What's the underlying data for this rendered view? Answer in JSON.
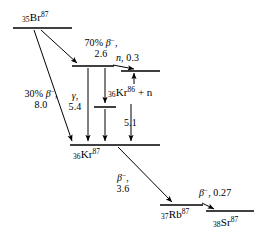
{
  "diagram": {
    "type": "nuclear-decay-level-scheme",
    "stroke_color": "#000000",
    "background_color": "#ffffff",
    "levels": [
      {
        "id": "br87",
        "nuclide_label": "Br",
        "z": "35",
        "a": "87"
      },
      {
        "id": "kr87-excited",
        "nuclide_label": "",
        "z": "",
        "a": ""
      },
      {
        "id": "kr86-plus-n",
        "nuclide_label": "Kr",
        "z": "36",
        "a": "86",
        "suffix": " + n"
      },
      {
        "id": "kr87-ground",
        "nuclide_label": "Kr",
        "z": "36",
        "a": "87"
      },
      {
        "id": "rb87",
        "nuclide_label": "Rb",
        "z": "37",
        "a": "87"
      },
      {
        "id": "sr87",
        "nuclide_label": "Sr",
        "z": "38",
        "a": "87"
      }
    ],
    "labels": {
      "br87": {
        "z": "35",
        "sym": "Br",
        "a": "87"
      },
      "kr87_ground": {
        "z": "36",
        "sym": "Kr",
        "a": "87"
      },
      "kr86_plus_n": {
        "z": "36",
        "sym": "Kr",
        "a": "86",
        "tail": "+ n"
      },
      "rb87": {
        "z": "37",
        "sym": "Rb",
        "a": "87"
      },
      "sr87": {
        "z": "38",
        "sym": "Sr",
        "a": "87"
      }
    },
    "transitions": [
      {
        "id": "beta-70",
        "kind": "beta-minus",
        "branch_percent": "70%",
        "symbol": "β",
        "charge": "−",
        "energy": "2.6",
        "line1": "70% β−,",
        "line2": "2.6"
      },
      {
        "id": "beta-30",
        "kind": "beta-minus",
        "branch_percent": "30%",
        "symbol": "β",
        "charge": "−",
        "energy": "8.0",
        "line1": "30% β−,",
        "line2": "8.0"
      },
      {
        "id": "gamma",
        "kind": "gamma",
        "symbol": "γ",
        "energy": "5.4",
        "line1": "γ,",
        "line2": "5.4"
      },
      {
        "id": "neutron-emission",
        "kind": "neutron",
        "symbol": "n",
        "energy": "0.3",
        "line1": "n, 0.3"
      },
      {
        "id": "neutron-5p1",
        "kind": "neutron-threshold",
        "energy": "5.1",
        "line1": "5.1"
      },
      {
        "id": "beta-kr87-to-rb87",
        "kind": "beta-minus",
        "symbol": "β",
        "charge": "−",
        "energy": "3.6",
        "line1": "β−,",
        "line2": "3.6"
      },
      {
        "id": "beta-rb87-to-sr87",
        "kind": "beta-minus",
        "symbol": "β",
        "charge": "−",
        "energy": "0.27",
        "line1": "β−, 0.27"
      }
    ]
  }
}
